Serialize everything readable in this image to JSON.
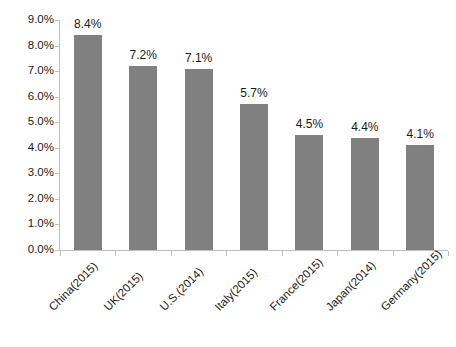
{
  "chart_data": {
    "type": "bar",
    "title": "",
    "subtitle": "",
    "xlabel": "",
    "ylabel": "",
    "categories": [
      "China(2015)",
      "UK(2015)",
      "U.S.(2014)",
      "Italy(2015)",
      "France(2015)",
      "Japan(2014)",
      "Germany(2015)"
    ],
    "values": [
      8.4,
      7.2,
      7.1,
      5.7,
      4.5,
      4.4,
      4.1
    ],
    "value_labels": [
      "8.4%",
      "7.2%",
      "7.1%",
      "5.7%",
      "4.5%",
      "4.4%",
      "4.1%"
    ],
    "ylim": [
      0.0,
      9.0
    ],
    "ytick_values": [
      0.0,
      1.0,
      2.0,
      3.0,
      4.0,
      5.0,
      6.0,
      7.0,
      8.0,
      9.0
    ],
    "ytick_labels": [
      "0.0%",
      "1.0%",
      "2.0%",
      "3.0%",
      "4.0%",
      "5.0%",
      "6.0%",
      "7.0%",
      "8.0%",
      "9.0%"
    ],
    "grid": false,
    "legend": false,
    "legend_position": "none",
    "bar_color": "#808080",
    "axis_color": "#bfbfbf",
    "text_color": "#1a1a1a",
    "background_color": "#ffffff",
    "xtick_label_rotation": -45
  }
}
